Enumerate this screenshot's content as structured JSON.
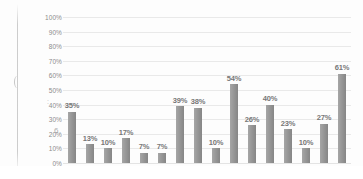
{
  "chart_data": {
    "type": "bar",
    "title": "",
    "subtitle": "",
    "xlabel": "",
    "ylabel": "",
    "ylim": [
      0,
      100
    ],
    "grid": true,
    "legend": null,
    "legend_position": "none",
    "y_ticks": [
      "0%",
      "10%",
      "20%",
      "30%",
      "40%",
      "50%",
      "60%",
      "70%",
      "80%",
      "90%",
      "100%"
    ],
    "y_tick_values": [
      0,
      10,
      20,
      30,
      40,
      50,
      60,
      70,
      80,
      90,
      100
    ],
    "categories": [
      "1",
      "2",
      "3",
      "4",
      "5",
      "6",
      "7",
      "8",
      "9",
      "10",
      "11",
      "12",
      "13",
      "14",
      "15",
      "16"
    ],
    "x_tick_labels": [
      "",
      "",
      "",
      "",
      "",
      "",
      "",
      "",
      "",
      "",
      "",
      "",
      "",
      "",
      "",
      ""
    ],
    "values": [
      35,
      13,
      10,
      17,
      7,
      7,
      39,
      38,
      10,
      54,
      26,
      40,
      23,
      10,
      27,
      61
    ],
    "data_labels": [
      "35%",
      "13%",
      "10%",
      "17%",
      "7%",
      "7%",
      "39%",
      "38%",
      "10%",
      "54%",
      "26%",
      "40%",
      "23%",
      "10%",
      "27%",
      "61%"
    ],
    "bar_color": "#8d8d8d",
    "gridline_color": "#e9e9e9",
    "label_color": "#777777",
    "axis_label_color": "#8c8c8c",
    "background_color": "#fdfdfd"
  }
}
